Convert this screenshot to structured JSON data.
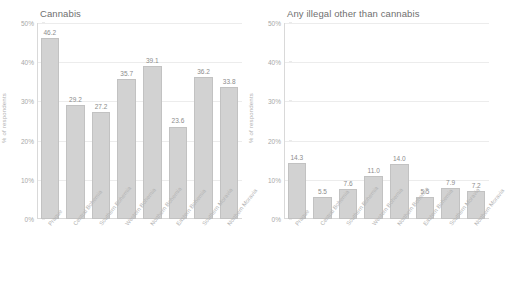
{
  "figure": {
    "background_color": "#ffffff",
    "bar_color": "#d2d2d2",
    "bar_border_color": "#c2c2c2",
    "text_color": "#8c8c8c",
    "grid_color": "#ececec"
  },
  "panels": [
    {
      "title": "Cannabis",
      "ylabel": "% of respondents",
      "yticks": [
        "0%",
        "10%",
        "20%",
        "30%",
        "40%",
        "50%"
      ],
      "categories": [
        "Prague",
        "Central Bohemia",
        "Southern Bohemia",
        "Western Bohemia",
        "Northern Bohemia",
        "Eastern Bohemia",
        "Southern Moravia",
        "Northern Moravia"
      ],
      "values": [
        46.2,
        29.2,
        27.2,
        35.7,
        39.1,
        23.6,
        36.2,
        33.8
      ],
      "value_labels": [
        "46.2",
        "29.2",
        "27.2",
        "35.7",
        "39.1",
        "23.6",
        "36.2",
        "33.8"
      ]
    },
    {
      "title": "Any illegal other than cannabis",
      "ylabel": "% of respondents",
      "yticks": [
        "0%",
        "10%",
        "20%",
        "30%",
        "40%",
        "50%"
      ],
      "categories": [
        "Prague",
        "Central Bohemia",
        "Southern Bohemia",
        "Western Bohemia",
        "Northern Bohemia",
        "Eastern Bohemia",
        "Southern Moravia",
        "Northern Moravia"
      ],
      "values": [
        14.3,
        5.5,
        7.6,
        11.0,
        14.0,
        5.5,
        7.9,
        7.2
      ],
      "value_labels": [
        "14.3",
        "5.5",
        "7.6",
        "11.0",
        "14.0",
        "5.5",
        "7.9",
        "7.2"
      ]
    }
  ],
  "chart_data": [
    {
      "type": "bar",
      "title": "Cannabis",
      "xlabel": "",
      "ylabel": "% of respondents",
      "ylim": [
        0,
        50
      ],
      "yticks": [
        0,
        10,
        20,
        30,
        40,
        50
      ],
      "ytick_labels": [
        "0%",
        "10%",
        "20%",
        "30%",
        "40%",
        "50%"
      ],
      "grid": true,
      "legend": "none",
      "categories": [
        "Prague",
        "Central Bohemia",
        "Southern Bohemia",
        "Western Bohemia",
        "Northern Bohemia",
        "Eastern Bohemia",
        "Southern Moravia",
        "Northern Moravia"
      ],
      "values": [
        46.2,
        29.2,
        27.2,
        35.7,
        39.1,
        23.6,
        36.2,
        33.8
      ],
      "data_labels": [
        "46.2",
        "29.2",
        "27.2",
        "35.7",
        "39.1",
        "23.6",
        "36.2",
        "33.8"
      ]
    },
    {
      "type": "bar",
      "title": "Any illegal other than cannabis",
      "xlabel": "",
      "ylabel": "% of respondents",
      "ylim": [
        0,
        50
      ],
      "yticks": [
        0,
        10,
        20,
        30,
        40,
        50
      ],
      "ytick_labels": [
        "0%",
        "10%",
        "20%",
        "30%",
        "40%",
        "50%"
      ],
      "grid": true,
      "legend": "none",
      "categories": [
        "Prague",
        "Central Bohemia",
        "Southern Bohemia",
        "Western Bohemia",
        "Northern Bohemia",
        "Eastern Bohemia",
        "Southern Moravia",
        "Northern Moravia"
      ],
      "values": [
        14.3,
        5.5,
        7.6,
        11.0,
        14.0,
        5.5,
        7.9,
        7.2
      ],
      "data_labels": [
        "14.3",
        "5.5",
        "7.6",
        "11.0",
        "14.0",
        "5.5",
        "7.9",
        "7.2"
      ]
    }
  ]
}
